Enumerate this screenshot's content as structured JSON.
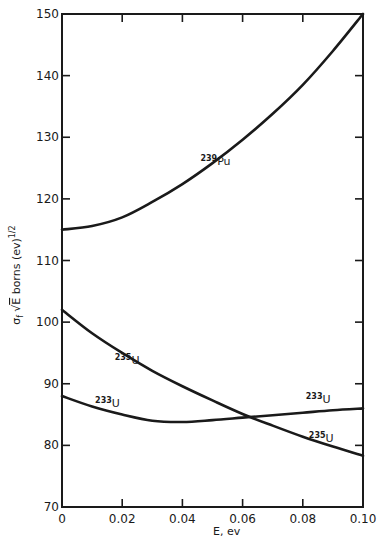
{
  "chart_data": {
    "type": "line",
    "title": "",
    "xlabel": "E, ev",
    "ylabel": "σf √E borns (ev)^1/2",
    "ylabel_parts": {
      "sigma": "σ",
      "sub": "f",
      "sqrt": "√",
      "E": "E",
      "unit": " borns (ev)",
      "exp": "1/2"
    },
    "xlim": [
      0,
      0.1
    ],
    "ylim": [
      70,
      150
    ],
    "grid": false,
    "legend": "inline labels",
    "x_ticks": [
      0,
      0.02,
      0.04,
      0.06,
      0.08,
      0.1
    ],
    "x_tick_labels": [
      "0",
      "0.02",
      "0.04",
      "0.06",
      "0.08",
      "0.10"
    ],
    "y_ticks": [
      70,
      80,
      90,
      100,
      110,
      120,
      130,
      140,
      150
    ],
    "y_tick_labels": [
      "70",
      "80",
      "90",
      "100",
      "110",
      "120",
      "130",
      "140",
      "150"
    ],
    "x": [
      0,
      0.01,
      0.02,
      0.03,
      0.04,
      0.05,
      0.06,
      0.07,
      0.08,
      0.09,
      0.1
    ],
    "series": [
      {
        "name": "239Pu",
        "mass": "239",
        "symbol": "Pu",
        "values": [
          115.0,
          115.6,
          117.0,
          119.5,
          122.4,
          125.8,
          129.6,
          133.8,
          138.5,
          144.0,
          150.0
        ],
        "label_at": {
          "x": 0.046,
          "y": 125.5
        }
      },
      {
        "name": "235U",
        "mass": "235",
        "symbol": "U",
        "values": [
          102.0,
          98.2,
          95.0,
          92.1,
          89.6,
          87.3,
          85.1,
          83.2,
          81.4,
          79.8,
          78.3
        ],
        "label_at": [
          {
            "x": 0.0175,
            "y": 93.2
          },
          {
            "x": 0.082,
            "y": 80.6
          }
        ]
      },
      {
        "name": "233U",
        "mass": "233",
        "symbol": "U",
        "values": [
          88.0,
          86.3,
          85.0,
          84.0,
          83.8,
          84.1,
          84.5,
          84.9,
          85.3,
          85.7,
          86.0
        ],
        "label_at": [
          {
            "x": 0.011,
            "y": 86.2
          },
          {
            "x": 0.081,
            "y": 86.9
          }
        ]
      }
    ]
  }
}
